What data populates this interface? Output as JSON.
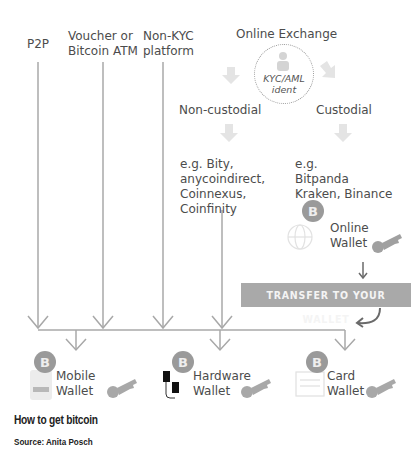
{
  "sources": {
    "p2p": "P2P",
    "voucher_line1": "Voucher or",
    "voucher_line2": "Bitcoin ATM",
    "nonkyc_line1": "Non-KYC",
    "nonkyc_line2": "platform",
    "online_exchange": "Online Exchange"
  },
  "kyc": {
    "line1": "KYC/AML",
    "line2": "ident"
  },
  "branches": {
    "non_custodial": "Non-custodial",
    "custodial": "Custodial",
    "non_custodial_examples": [
      "e.g. Bity,",
      "anycoindirect,",
      "Coinnexus,",
      "Coinfinity"
    ],
    "custodial_examples": [
      "e.g.",
      "Bitpanda",
      "Kraken, Binance"
    ]
  },
  "online_wallet": {
    "line1": "Online",
    "line2": "Wallet"
  },
  "transfer_label": "TRANSFER TO YOUR WALLET",
  "wallets": [
    {
      "line1": "Mobile",
      "line2": "Wallet"
    },
    {
      "line1": "Hardware",
      "line2": "Wallet"
    },
    {
      "line1": "Card",
      "line2": "Wallet"
    }
  ],
  "caption": {
    "title": "How to get bitcoin",
    "source": "Source: Anita Posch"
  },
  "colors": {
    "line": "#a8a8a8",
    "bitcoin": "#9e9e9e",
    "key": "#a0a0a0",
    "transfer_bg": "#a9a9a9",
    "light_arrow": "#e2e2e2"
  }
}
